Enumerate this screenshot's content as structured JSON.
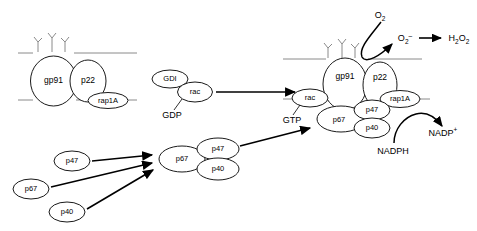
{
  "figure": {
    "background_color": "#ffffff",
    "membrane_color": "#8a8a8a",
    "outline_color": "#1a1a1a"
  },
  "resting_complex": {
    "name": "resting membrane flavocytochrome b558",
    "subunits": [
      {
        "id": "gp91",
        "label": "gp91"
      },
      {
        "id": "p22",
        "label": "p22"
      },
      {
        "id": "rap1A",
        "label": "rap1A"
      }
    ]
  },
  "rac_cycle": {
    "gdi_label": "GDI",
    "rac_label": "rac",
    "gdp_label": "GDP",
    "gtp_label": "GTP"
  },
  "cytosolic_subunits": [
    {
      "id": "p47-free",
      "label": "p47"
    },
    {
      "id": "p67-free",
      "label": "p67"
    },
    {
      "id": "p40-free",
      "label": "p40"
    }
  ],
  "cytosolic_complex": {
    "name": "assembled cytosolic oxidase complex",
    "subunits": [
      {
        "id": "p67-assembled",
        "label": "p67"
      },
      {
        "id": "p47-assembled",
        "label": "p47"
      },
      {
        "id": "p40-assembled",
        "label": "p40"
      }
    ]
  },
  "active_complex": {
    "name": "active NADPH oxidase complex",
    "subunits": [
      {
        "id": "gp91-active",
        "label": "gp91"
      },
      {
        "id": "p22-active",
        "label": "p22"
      },
      {
        "id": "rap1A-active",
        "label": "rap1A"
      },
      {
        "id": "rac-active",
        "label": "rac"
      },
      {
        "id": "p67-active",
        "label": "p67"
      },
      {
        "id": "p47-active",
        "label": "p47"
      },
      {
        "id": "p40-active",
        "label": "p40"
      }
    ]
  },
  "reactions": {
    "oxygen": {
      "base": "O",
      "sub": "2"
    },
    "superoxide": {
      "base": "O",
      "sub": "2",
      "sup": "–"
    },
    "hydrogen_peroxide": {
      "base": "H",
      "sub": "2",
      "base2": "O",
      "sub2": "2"
    },
    "nadph_label": "NADPH",
    "nadp_plus": {
      "base": "NADP",
      "sup": "+"
    }
  }
}
